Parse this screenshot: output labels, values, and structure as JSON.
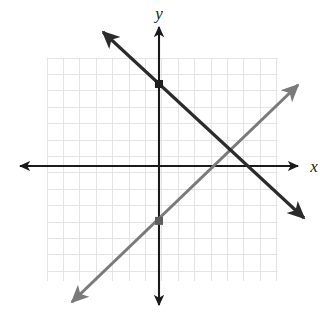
{
  "figure": {
    "kind": "coordinate-plane-graph",
    "width": 333,
    "height": 321,
    "background": "#ffffff"
  },
  "axes": {
    "x_label": "x",
    "y_label": "y",
    "axis_color": "#1a1a1a",
    "origin_px": {
      "x": 159,
      "y": 166
    },
    "unit_px": 16.4,
    "x_axis_px": {
      "x1": 20,
      "x2": 298,
      "y": 166
    },
    "y_axis_px": {
      "x": 159,
      "y1": 27,
      "y2": 305
    },
    "arrowheads": [
      "left",
      "right",
      "up",
      "down"
    ],
    "tick_labels_visible": false
  },
  "grid": {
    "visible": true,
    "color": "#e4e4e4",
    "spacing_px": 16.4,
    "left_px": 47,
    "top_px": 58,
    "right_px": 278,
    "bottom_px": 281,
    "columns": 14,
    "rows": 13.6
  },
  "chart_data": {
    "type": "line",
    "title": "",
    "xlabel": "x",
    "ylabel": "y",
    "grid": true,
    "legend_position": "none",
    "xlim": [
      -8.5,
      8.5
    ],
    "ylim": [
      -8.5,
      8.5
    ],
    "series": [
      {
        "name": "dark-line",
        "color": "#2b2b2b",
        "slope": -1,
        "y_intercept": 5,
        "equation": "y = -x + 5",
        "marked_point": {
          "x": 0,
          "y": 5
        },
        "endpoints_px": [
          {
            "x": 103,
            "y": 32
          },
          {
            "x": 304,
            "y": 218
          }
        ],
        "arrow_both_ends": true
      },
      {
        "name": "gray-line",
        "color": "#7a7a7a",
        "slope": 1,
        "y_intercept": -3.35,
        "equation": "y = x - 3",
        "marked_point": {
          "x": 0,
          "y": -3.35
        },
        "endpoints_px": [
          {
            "x": 72,
            "y": 302
          },
          {
            "x": 298,
            "y": 85
          }
        ],
        "arrow_both_ends": true
      }
    ],
    "intersection_px": {
      "x": 232,
      "y": 152
    },
    "intersection_point": {
      "x": 4,
      "y": 1
    }
  }
}
